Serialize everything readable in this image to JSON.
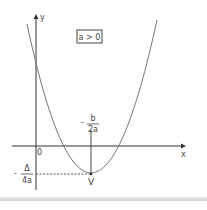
{
  "diagram": {
    "title_box": "a > 0",
    "axes": {
      "x_label": "x",
      "y_label": "y",
      "origin_label": "0"
    },
    "vertex": {
      "label": "V",
      "x_coord": {
        "sign": "-",
        "numerator": "b",
        "denominator": "2a"
      },
      "y_coord": {
        "sign": "-",
        "numerator": "Δ",
        "denominator": "4a"
      }
    },
    "curve": "upward-opening parabola",
    "colors": {
      "axis": "#333333",
      "curve": "#666666",
      "text": "#444444",
      "dashed": "#555555"
    }
  }
}
